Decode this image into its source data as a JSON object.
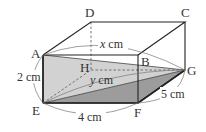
{
  "diagram": {
    "type": "rectangular-prism",
    "vertices": {
      "A": {
        "label": "A",
        "x": 43,
        "y": 55
      },
      "B": {
        "label": "B",
        "x": 138,
        "y": 55
      },
      "C": {
        "label": "C",
        "x": 185,
        "y": 22
      },
      "D": {
        "label": "D",
        "x": 91,
        "y": 22
      },
      "E": {
        "label": "E",
        "x": 43,
        "y": 103
      },
      "F": {
        "label": "F",
        "x": 138,
        "y": 103
      },
      "G": {
        "label": "G",
        "x": 185,
        "y": 70
      },
      "H": {
        "label": "H",
        "x": 91,
        "y": 70
      }
    },
    "measurements": {
      "AE": "2 cm",
      "EF": "4 cm",
      "FG": "5 cm",
      "AG": "x cm",
      "EG": "y cm"
    },
    "labels": {
      "A": "A",
      "B": "B",
      "C": "C",
      "D": "D",
      "E": "E",
      "F": "F",
      "G": "G",
      "H": "H",
      "height": "2 cm",
      "length": "4 cm",
      "width": "5 cm",
      "x_var": "x",
      "x_unit": "cm",
      "y_var": "y",
      "y_unit": "cm"
    },
    "colors": {
      "edge": "#222222",
      "hidden_edge": "#555555",
      "triangle_AEG": "#d2d2d2",
      "triangle_EFG": "#9c9c9c",
      "arc": "#777777"
    }
  }
}
